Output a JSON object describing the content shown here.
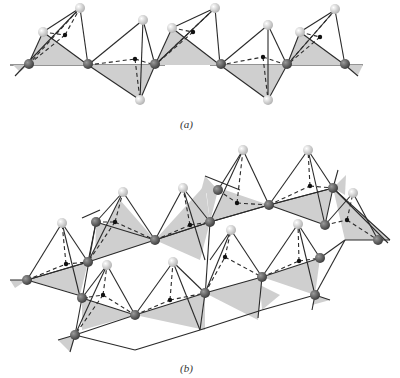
{
  "figure": {
    "panel_a": {
      "label": "(a)"
    },
    "panel_b": {
      "label": "(b)"
    }
  },
  "colors": {
    "face_fill": "#cfcfcf",
    "edge": "#2a2a2a",
    "bridging_atom": "#5a5a5a",
    "apex_atom": "#d8d8d8",
    "center_atom": "#111111"
  },
  "chains": {
    "a": {
      "baseline_y": 65,
      "nodes_x": [
        28,
        88,
        155,
        220,
        287,
        345
      ],
      "apexes": [
        {
          "x": 80,
          "y": 8,
          "type": "up"
        },
        {
          "x": 143,
          "y": 20,
          "type": "up"
        },
        {
          "x": 140,
          "y": 100,
          "type": "down"
        },
        {
          "x": 215,
          "y": 8,
          "type": "up"
        },
        {
          "x": 268,
          "y": 25,
          "type": "up"
        },
        {
          "x": 268,
          "y": 100,
          "type": "down"
        },
        {
          "x": 335,
          "y": 10,
          "type": "up"
        }
      ]
    }
  }
}
